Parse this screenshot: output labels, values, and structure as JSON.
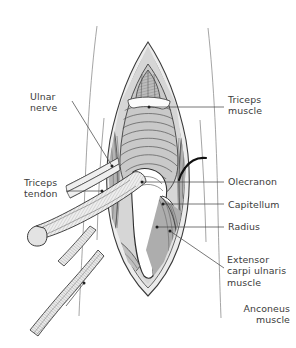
{
  "figure": {
    "panel_tag": "(c)"
  },
  "labels": [
    {
      "id": "ulnar-nerve",
      "text": "Ulnar\nnerve",
      "align": "left",
      "x": 30,
      "y": 91,
      "leader": {
        "x1": 72,
        "y1": 101,
        "x2": 112,
        "y2": 166
      },
      "dot": {
        "x": 112,
        "y": 166
      }
    },
    {
      "id": "triceps-muscle",
      "text": "Triceps\nmuscle",
      "align": "left",
      "x": 228,
      "y": 94,
      "leader": {
        "x1": 224,
        "y1": 107,
        "x2": 149,
        "y2": 107
      },
      "dot": {
        "x": 149,
        "y": 107
      }
    },
    {
      "id": "triceps-tendon",
      "text": "Triceps\ntendon",
      "align": "left",
      "x": 24,
      "y": 177,
      "leader": {
        "x1": 66,
        "y1": 191,
        "x2": 102,
        "y2": 191
      },
      "dot": {
        "x": 102,
        "y": 191
      }
    },
    {
      "id": "olecranon",
      "text": "Olecranon",
      "align": "left",
      "x": 228,
      "y": 176,
      "leader": {
        "x1": 224,
        "y1": 182,
        "x2": 142,
        "y2": 182
      },
      "dot": {
        "x": 142,
        "y": 182
      }
    },
    {
      "id": "capitellum",
      "text": "Capitellum",
      "align": "left",
      "x": 228,
      "y": 199,
      "leader": {
        "x1": 224,
        "y1": 204,
        "x2": 163,
        "y2": 204
      },
      "dot": {
        "x": 163,
        "y": 204
      }
    },
    {
      "id": "radius",
      "text": "Radius",
      "align": "left",
      "x": 228,
      "y": 221,
      "leader": {
        "x1": 224,
        "y1": 227,
        "x2": 157,
        "y2": 227
      },
      "dot": {
        "x": 157,
        "y": 227
      }
    },
    {
      "id": "extensor-carpi-ulnaris-muscle",
      "text": "Extensor\ncarpi ulnaris\nmuscle",
      "align": "left",
      "x": 227,
      "y": 254,
      "leader": {
        "x1": 224,
        "y1": 268,
        "x2": 170,
        "y2": 231
      },
      "dot": {
        "x": 170,
        "y": 231
      }
    },
    {
      "id": "anconeus-muscle",
      "text": "Anconeus\nmuscle",
      "align": "right",
      "x": 6,
      "y": 303,
      "leader": {
        "x1": 66,
        "y1": 306,
        "x2": 84,
        "y2": 283
      },
      "dot": {
        "x": 84,
        "y": 283
      }
    }
  ],
  "colors": {
    "ink": "#2b2b2b",
    "label_text": "#3b3b3b",
    "leader_line": "#4a4a4a",
    "skin_light": "#eeeeee",
    "fascia": "#dcdcdc",
    "muscle_light": "#d2d2d2",
    "muscle_mid": "#bdbdbd",
    "muscle_dark": "#9e9e9e",
    "muscle_darkest": "#8a8a8a",
    "bone": "#ffffff",
    "tendon": "#e6e6e6",
    "retractor": "#111111",
    "background": "#ffffff"
  }
}
